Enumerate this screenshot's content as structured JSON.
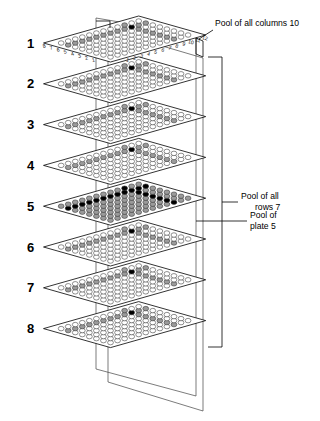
{
  "figure": {
    "type": "diagram",
    "plate_count": 8,
    "plate_rows": 8,
    "plate_columns": 12,
    "row_axis_labels": [
      "1",
      "2",
      "3",
      "4",
      "5",
      "6",
      "7",
      "8"
    ],
    "column_axis_labels": [
      "1",
      "2",
      "3",
      "4",
      "5",
      "6",
      "7",
      "8",
      "9",
      "10",
      "11",
      "12"
    ],
    "plate_labels": [
      "1",
      "2",
      "3",
      "4",
      "5",
      "6",
      "7",
      "8"
    ],
    "highlight": {
      "pooled_column_index": 10,
      "pooled_row_index": 7,
      "pooled_plate_index": 5,
      "target_well": "plate 5, row 7, column 10"
    },
    "colors": {
      "well_empty": "#ffffff",
      "well_pooled": "#9a9a9a",
      "well_target": "#000000",
      "outline": "#000000",
      "plane": "#444444"
    }
  },
  "annotations": [
    {
      "id": "pool-columns",
      "line1": "Pool of all columns 10",
      "line2": ""
    },
    {
      "id": "pool-rows",
      "line1": "Pool of all",
      "line2": "rows 7"
    },
    {
      "id": "pool-plate",
      "line1": "Pool of",
      "line2": "plate 5"
    }
  ]
}
